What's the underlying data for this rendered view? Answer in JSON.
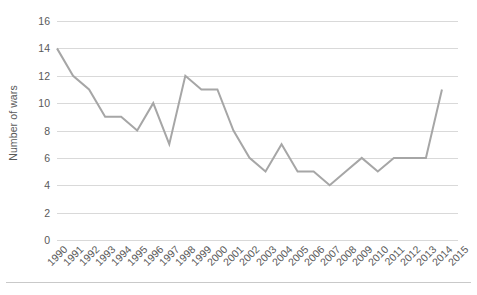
{
  "chart_data": {
    "type": "line",
    "title": "",
    "subtitle": "",
    "xlabel": "",
    "ylabel": "Number of wars",
    "categories": [
      "1990",
      "1991",
      "1992",
      "1993",
      "1994",
      "1995",
      "1996",
      "1997",
      "1998",
      "1999",
      "2000",
      "2001",
      "2002",
      "2003",
      "2004",
      "2005",
      "2006",
      "2007",
      "2008",
      "2009",
      "2010",
      "2011",
      "2012",
      "2013",
      "2014",
      "2015"
    ],
    "values": [
      14,
      12,
      11,
      9,
      9,
      8,
      10,
      7,
      12,
      11,
      11,
      8,
      6,
      5,
      7,
      5,
      5,
      4,
      5,
      6,
      5,
      6,
      6,
      6,
      11,
      null
    ],
    "series": [
      {
        "name": "Number of wars",
        "values": [
          14,
          12,
          11,
          9,
          9,
          8,
          10,
          7,
          12,
          11,
          11,
          8,
          6,
          5,
          7,
          5,
          5,
          4,
          5,
          6,
          5,
          6,
          6,
          6,
          11,
          null
        ],
        "color": "#a6a6a6"
      }
    ],
    "ylim": [
      0,
      16
    ],
    "ytick_step": 2,
    "yticks": [
      16,
      14,
      12,
      10,
      8,
      6,
      4,
      2,
      0
    ],
    "ytick_labels": [
      "16",
      "14",
      "12",
      "10",
      "8",
      "6",
      "4",
      "2",
      "0"
    ],
    "grid": true,
    "grid_axis": "y",
    "grid_color": "#d9d9d9",
    "legend": false,
    "legend_position": "none",
    "axis_label_color": "#595959",
    "line_color": "#a6a6a6",
    "line_width": 2,
    "markers": false,
    "x_tick_rotation": -45,
    "background_color": "#ffffff"
  }
}
